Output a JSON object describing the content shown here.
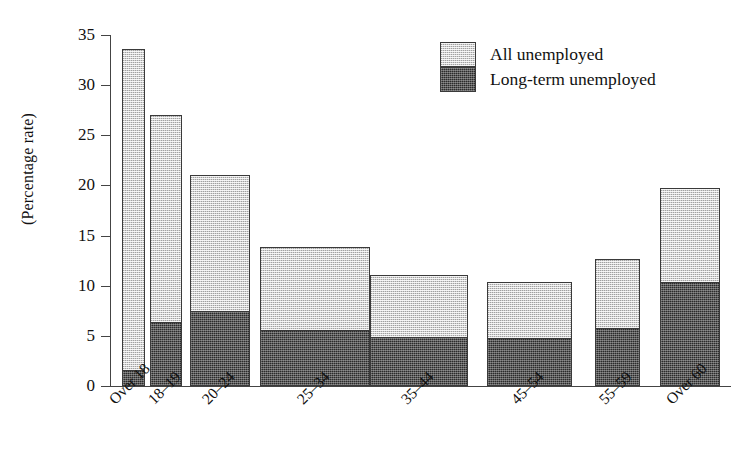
{
  "chart_data": {
    "type": "bar",
    "subtype": "stacked-bar",
    "title": "",
    "xlabel": "",
    "ylabel": "(Percentage rate)",
    "ylim": [
      0,
      35
    ],
    "yticks": [
      0,
      5,
      10,
      15,
      20,
      25,
      30,
      35
    ],
    "grid": false,
    "legend_position": "top-right",
    "categories": [
      "Over 18",
      "18–19",
      "20–24",
      "25–34",
      "35–44",
      "45–54",
      "55–59",
      "Over 60"
    ],
    "series": [
      {
        "name": "All unemployed",
        "note": "total height of each stacked bar",
        "values": [
          33.6,
          27.0,
          21.0,
          13.9,
          11.1,
          10.4,
          12.7,
          19.7
        ]
      },
      {
        "name": "Long-term unemployed",
        "note": "dark lower segment of each stacked bar",
        "values": [
          1.6,
          6.4,
          7.5,
          5.6,
          4.9,
          4.8,
          5.8,
          10.4
        ]
      }
    ],
    "bar_widths_px": [
      23,
      32,
      60,
      110,
      98,
      85,
      45,
      60
    ],
    "bar_left_px": [
      122,
      150,
      190,
      260,
      370,
      487,
      595,
      660
    ],
    "colors": {
      "all_unemployed_fill": "#d2d2d2",
      "long_term_fill": "#2b2b2b",
      "outline": "#3a3a3a",
      "axis": "#444444",
      "background": "#ffffff",
      "text": "#111111"
    }
  },
  "legend": {
    "items": [
      {
        "label": "All unemployed"
      },
      {
        "label": "Long-term unemployed"
      }
    ]
  },
  "axis": {
    "y_title": "(Percentage rate)",
    "y_tick_labels": [
      "35",
      "30",
      "25",
      "20",
      "15",
      "10",
      "5",
      "0"
    ]
  }
}
